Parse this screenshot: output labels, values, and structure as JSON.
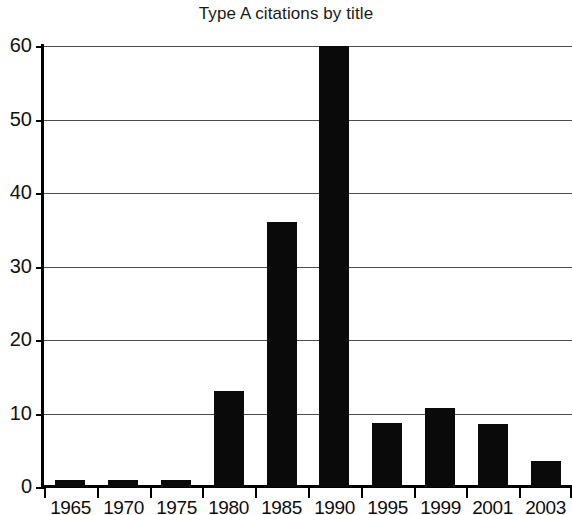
{
  "chart_data": {
    "type": "bar",
    "title": "Type A citations by title",
    "xlabel": "",
    "ylabel": "",
    "categories": [
      "1965",
      "1970",
      "1975",
      "1980",
      "1985",
      "1990",
      "1995",
      "1999",
      "2001",
      "2003"
    ],
    "values": [
      1,
      1,
      1,
      13,
      36,
      60,
      8.7,
      10.7,
      8.6,
      3.5
    ],
    "ylim": [
      0,
      60
    ],
    "yticks": [
      0,
      10,
      20,
      30,
      40,
      50,
      60
    ],
    "ytick_labels": [
      "0",
      "10",
      "20",
      "30",
      "40",
      "50",
      "60"
    ],
    "grid": true,
    "legend": null,
    "bar_color": "#0a0a0a",
    "grid_color": "#4c4c4c",
    "axis_color": "#000000",
    "background": "#ffffff"
  }
}
